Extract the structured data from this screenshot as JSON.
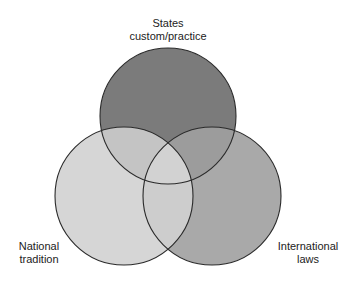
{
  "diagram": {
    "type": "venn",
    "sets": [
      {
        "id": "top",
        "label_line1": "States",
        "label_line2": "custom/practice",
        "fill": "#7b7b7b",
        "cx": 168,
        "cy": 116,
        "r": 68
      },
      {
        "id": "left",
        "label_line1": "National",
        "label_line2": "tradition",
        "fill": "#d6d6d6",
        "cx": 124,
        "cy": 196,
        "r": 69
      },
      {
        "id": "right",
        "label_line1": "International",
        "label_line2": "laws",
        "fill": "#a9a9a9",
        "cx": 212,
        "cy": 196,
        "r": 69
      }
    ],
    "overlap_colors": {
      "top_left": "#c4c4c4",
      "top_right": "#9c9c9c",
      "left_right": "#cdcdcd",
      "all": "#d2d2d2"
    },
    "stroke": "#2a2a2a"
  }
}
